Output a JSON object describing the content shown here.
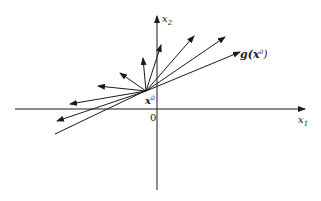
{
  "diagram": {
    "axes": {
      "x_label": "x",
      "x_sub": "1",
      "y_label": "x",
      "y_sub": "2",
      "origin_label": "0"
    },
    "point_label": "x",
    "point_sup": "0",
    "gradient_label_prefix": "g(",
    "gradient_label_x": "x",
    "gradient_label_sup": "0",
    "gradient_label_suffix": ")",
    "colors": {
      "stroke": "#1a1a1a",
      "background": "#ffffff"
    }
  }
}
